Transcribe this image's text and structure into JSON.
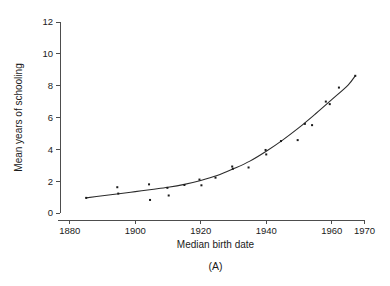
{
  "figure": {
    "panel_label": "(A)",
    "background_color": "#ffffff",
    "ink_color": "#1a1a1a"
  },
  "chart_data": {
    "type": "scatter",
    "title": "",
    "subtitle": "",
    "xlabel": "Median birth date",
    "ylabel": "Mean years of schooling",
    "xlim": [
      1877,
      1972
    ],
    "ylim": [
      0,
      12
    ],
    "grid": false,
    "legend": null,
    "legend_position": "none",
    "annotations": [
      "(A)"
    ],
    "xticks": [
      1880,
      1900,
      1920,
      1940,
      1960,
      1970
    ],
    "xtick_labels": [
      "1880",
      "1900",
      "1920",
      "1940",
      "1960",
      "1970"
    ],
    "yticks": [
      0,
      2,
      4,
      6,
      8,
      10,
      12
    ],
    "ytick_labels": [
      "0",
      "2",
      "4",
      "6",
      "8",
      "10",
      "12"
    ],
    "series": [
      {
        "name": "observed",
        "type": "scatter",
        "marker": "square",
        "points": [
          [
            1885.0,
            0.95
          ],
          [
            1894.5,
            1.62
          ],
          [
            1894.8,
            1.22
          ],
          [
            1904.2,
            1.8
          ],
          [
            1904.5,
            0.82
          ],
          [
            1909.8,
            1.58
          ],
          [
            1910.2,
            1.1
          ],
          [
            1915.0,
            1.76
          ],
          [
            1919.6,
            2.1
          ],
          [
            1920.2,
            1.74
          ],
          [
            1924.5,
            2.22
          ],
          [
            1929.6,
            2.92
          ],
          [
            1929.8,
            2.78
          ],
          [
            1934.6,
            2.86
          ],
          [
            1939.8,
            3.96
          ],
          [
            1940.0,
            3.68
          ],
          [
            1944.5,
            4.52
          ],
          [
            1949.6,
            4.58
          ],
          [
            1951.8,
            5.6
          ],
          [
            1954.0,
            5.52
          ],
          [
            1958.2,
            7.0
          ],
          [
            1959.4,
            6.84
          ],
          [
            1962.2,
            7.88
          ],
          [
            1967.2,
            8.62
          ]
        ]
      },
      {
        "name": "fitted curve",
        "type": "line",
        "points": [
          [
            1885.0,
            0.95
          ],
          [
            1890.0,
            1.08
          ],
          [
            1895.0,
            1.21
          ],
          [
            1900.0,
            1.34
          ],
          [
            1905.0,
            1.48
          ],
          [
            1910.0,
            1.62
          ],
          [
            1915.0,
            1.8
          ],
          [
            1920.0,
            2.04
          ],
          [
            1925.0,
            2.35
          ],
          [
            1930.0,
            2.78
          ],
          [
            1935.0,
            3.26
          ],
          [
            1940.0,
            3.88
          ],
          [
            1945.0,
            4.58
          ],
          [
            1950.0,
            5.36
          ],
          [
            1955.0,
            6.22
          ],
          [
            1960.0,
            7.12
          ],
          [
            1965.0,
            8.04
          ],
          [
            1967.2,
            8.62
          ]
        ]
      }
    ]
  }
}
